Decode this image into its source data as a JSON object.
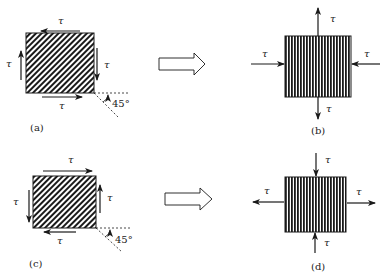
{
  "diagram": {
    "symbol": "τ",
    "angle_label": "45°",
    "colors": {
      "line": "#1a1a1a",
      "hatch": "#1a1a1a",
      "background": "#ffffff"
    },
    "panels": [
      {
        "id": "a",
        "caption": "(a)",
        "hatch": "diagonal",
        "stress_labels": {
          "top": "τ",
          "right": "τ",
          "bottom": "τ",
          "left": "τ"
        },
        "arrows": {
          "top": "left",
          "right": "down",
          "bottom": "right",
          "left": "up"
        },
        "angle": "45°"
      },
      {
        "id": "b",
        "caption": "(b)",
        "hatch": "vertical",
        "stress_labels": {
          "top": "τ",
          "right": "τ",
          "bottom": "τ",
          "left": "τ"
        },
        "arrows": {
          "top": "tension-up",
          "bottom": "tension-down",
          "left": "compression-in",
          "right": "compression-in"
        }
      },
      {
        "id": "c",
        "caption": "(c)",
        "hatch": "diagonal",
        "stress_labels": {
          "top": "τ",
          "right": "τ",
          "bottom": "τ",
          "left": "τ"
        },
        "arrows": {
          "top": "right",
          "right": "up",
          "bottom": "left",
          "left": "down"
        },
        "angle": "45°"
      },
      {
        "id": "d",
        "caption": "(d)",
        "hatch": "vertical",
        "stress_labels": {
          "top": "τ",
          "right": "τ",
          "bottom": "τ",
          "left": "τ"
        },
        "arrows": {
          "top": "compression-in",
          "bottom": "compression-in",
          "left": "tension-out",
          "right": "tension-out"
        }
      }
    ],
    "transform_arrows": [
      {
        "from": "a",
        "to": "b"
      },
      {
        "from": "c",
        "to": "d"
      }
    ]
  }
}
